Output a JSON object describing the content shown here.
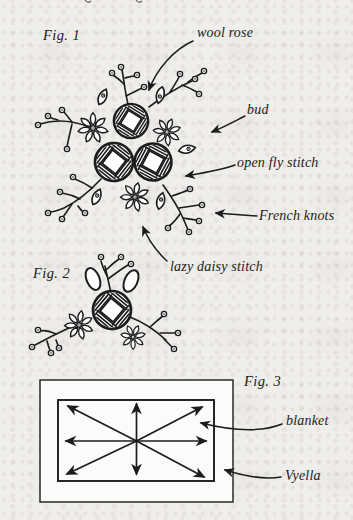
{
  "page": {
    "paper_color": "#f0eeeb",
    "ink_color": "#1c1c1c",
    "fig3_box_fill": "#fbfbf9"
  },
  "fig1": {
    "caption": "Fig. 1",
    "labels": {
      "wool_rose": "wool rose",
      "bud": "bud",
      "open_fly_stitch": "open fly stitch",
      "french_knots": "French knots",
      "lazy_daisy_stitch": "lazy daisy stitch"
    }
  },
  "fig2": {
    "caption": "Fig. 2"
  },
  "fig3": {
    "caption": "Fig. 3",
    "labels": {
      "blanket": "blanket",
      "vyella": "Vyella"
    }
  }
}
